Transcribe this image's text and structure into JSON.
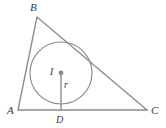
{
  "figure": {
    "type": "geometry-diagram",
    "width": 166,
    "height": 128,
    "background_color": "#ffffff",
    "stroke_color": "#8c8c8c",
    "label_color": "#3a3a3a",
    "dot_color": "#8c8c8c",
    "stroke_width": 1.4
  },
  "labels": {
    "vertex_a": "A",
    "vertex_b": "B",
    "vertex_c": "C",
    "incenter": "I",
    "radius": "r",
    "tangent_point_d": "D"
  },
  "geometry": {
    "triangle": {
      "vertices": [
        {
          "name": "A",
          "x": 18,
          "y": 110
        },
        {
          "name": "B",
          "x": 37,
          "y": 17
        },
        {
          "name": "C",
          "x": 147,
          "y": 110
        }
      ],
      "sides": [
        "AB",
        "BC",
        "CA"
      ]
    },
    "incircle": {
      "center_x": 61,
      "center_y": 73,
      "radius": 31
    },
    "incenter_dot": {
      "x": 61,
      "y": 73,
      "r": 2.4
    },
    "radius_segment": {
      "x1": 61,
      "y1": 73,
      "x2": 61,
      "y2": 110
    },
    "tangent_point": {
      "name": "D",
      "x": 61,
      "y": 110
    }
  },
  "label_positions": {
    "vertex_b": {
      "x": 30,
      "y": 2
    },
    "vertex_a": {
      "x": 7,
      "y": 105
    },
    "vertex_c": {
      "x": 151,
      "y": 105
    },
    "incenter": {
      "x": 50,
      "y": 67
    },
    "radius": {
      "x": 64,
      "y": 80
    },
    "tangent_point_d": {
      "x": 56,
      "y": 115
    }
  }
}
